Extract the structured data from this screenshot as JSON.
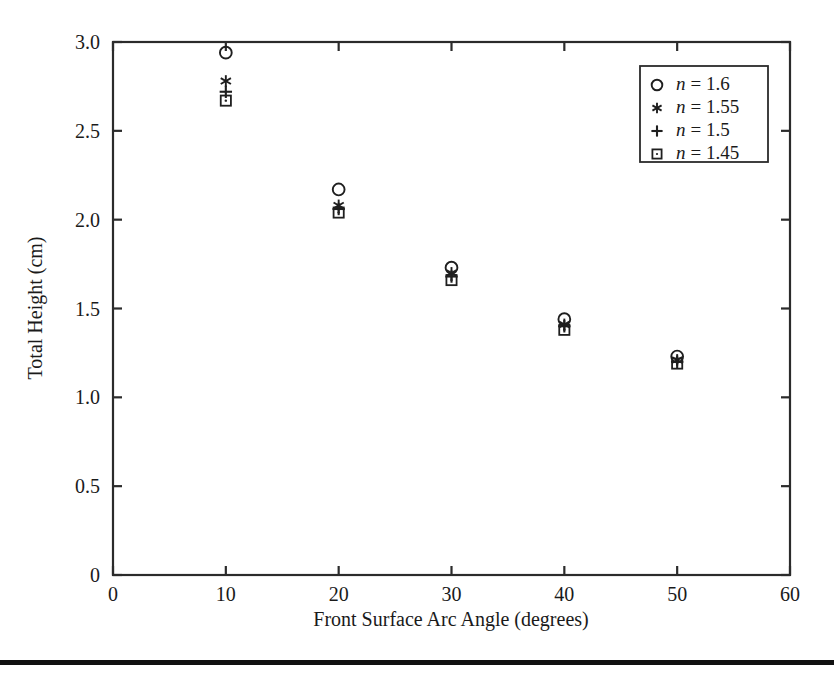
{
  "figure": {
    "background_color": "#ffffff",
    "ink_color": "#1a1a1a",
    "bottom_rule_color": "#111111"
  },
  "chart_data": {
    "type": "scatter",
    "title": "",
    "xlabel": "Front Surface Arc Angle (degrees)",
    "ylabel": "Total Height (cm)",
    "xlim": [
      0,
      60
    ],
    "ylim": [
      0,
      3.0
    ],
    "xticks": [
      0,
      10,
      20,
      30,
      40,
      50,
      60
    ],
    "xtick_labels": [
      "0",
      "10",
      "20",
      "30",
      "40",
      "50",
      "60"
    ],
    "yticks": [
      0,
      0.5,
      1.0,
      1.5,
      2.0,
      2.5,
      3.0
    ],
    "ytick_labels": [
      "0",
      "0.5",
      "1.0",
      "1.5",
      "2.0",
      "2.5",
      "3.0"
    ],
    "grid": false,
    "legend_position": "upper right",
    "x": [
      10,
      20,
      30,
      40,
      50
    ],
    "series": [
      {
        "name": "n = 1.6",
        "marker": "circle",
        "legend_label_prefix": "n",
        "legend_label_value": "= 1.6",
        "values": [
          2.94,
          2.17,
          1.73,
          1.44,
          1.23
        ]
      },
      {
        "name": "n = 1.55",
        "marker": "asterisk",
        "legend_label_prefix": "n",
        "legend_label_value": "= 1.55",
        "values": [
          2.78,
          2.08,
          1.7,
          1.41,
          1.21
        ]
      },
      {
        "name": "n = 1.5",
        "marker": "plus",
        "legend_label_prefix": "n",
        "legend_label_value": "= 1.5",
        "values": [
          2.72,
          2.06,
          1.68,
          1.4,
          1.2
        ]
      },
      {
        "name": "n = 1.45",
        "marker": "square",
        "legend_label_prefix": "n",
        "legend_label_value": "= 1.45",
        "values": [
          2.67,
          2.04,
          1.66,
          1.38,
          1.19
        ]
      }
    ]
  },
  "axes": {
    "x_title": "Front Surface Arc Angle (degrees)",
    "y_title": "Total Height (cm)",
    "x_tick_labels": [
      "0",
      "10",
      "20",
      "30",
      "40",
      "50",
      "60"
    ],
    "y_tick_labels": [
      "0",
      "0.5",
      "1.0",
      "1.5",
      "2.0",
      "2.5",
      "3.0"
    ]
  },
  "legend": {
    "entries": [
      {
        "marker": "circle",
        "var": "n",
        "text": "= 1.6"
      },
      {
        "marker": "asterisk",
        "var": "n",
        "text": "= 1.55"
      },
      {
        "marker": "plus",
        "var": "n",
        "text": "= 1.5"
      },
      {
        "marker": "square",
        "var": "n",
        "text": "= 1.45"
      }
    ]
  }
}
